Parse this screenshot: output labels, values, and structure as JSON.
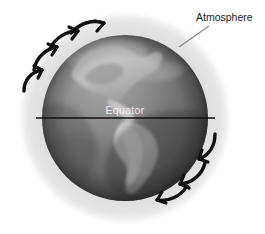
{
  "figure": {
    "title_visible": false,
    "background_color": "#ffffff"
  },
  "labels": {
    "atmosphere": "Atmosphere",
    "equator": "Equator"
  },
  "colors": {
    "background": "#ffffff",
    "atmosphere_halo": "#dedede",
    "globe_ocean_light": "#9a9a9a",
    "globe_ocean_dark": "#4a4a4a",
    "globe_land": "#c4c4c4",
    "arrow": "#111111",
    "leader_line": "#8d8d8d",
    "equator_line": "#101010",
    "label_text": "#1b1b1b",
    "equator_text": "#f2f2f2"
  },
  "geometry": {
    "atmosphere": {
      "cx": 125,
      "cy": 118,
      "r": 105
    },
    "globe": {
      "cx": 125,
      "cy": 118,
      "r": 83
    },
    "equator_line": {
      "x1": 36,
      "y1": 118,
      "x2": 215,
      "y2": 118
    },
    "leader_line": {
      "x1": 179,
      "y1": 47,
      "x2": 209,
      "y2": 26
    }
  },
  "arrows": {
    "description": "Six thick curved arrows indicating clockwise atmospheric circulation around the globe",
    "rotation_direction": "clockwise",
    "upper_left_count": 3,
    "lower_right_count": 3
  },
  "continents": [
    {
      "name": "north-america"
    },
    {
      "name": "central-america"
    },
    {
      "name": "south-america"
    }
  ]
}
